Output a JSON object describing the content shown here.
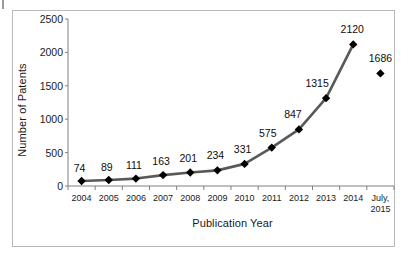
{
  "chart_data": {
    "type": "line",
    "title": "",
    "xlabel": "Publication Year",
    "ylabel": "Number of Patents",
    "categories": [
      "2004",
      "2005",
      "2006",
      "2007",
      "2008",
      "2009",
      "2010",
      "2011",
      "2012",
      "2013",
      "2014",
      "July,\n2015"
    ],
    "category_labels": [
      {
        "line1": "2004",
        "line2": ""
      },
      {
        "line1": "2005",
        "line2": ""
      },
      {
        "line1": "2006",
        "line2": ""
      },
      {
        "line1": "2007",
        "line2": ""
      },
      {
        "line1": "2008",
        "line2": ""
      },
      {
        "line1": "2009",
        "line2": ""
      },
      {
        "line1": "2010",
        "line2": ""
      },
      {
        "line1": "2011",
        "line2": ""
      },
      {
        "line1": "2012",
        "line2": ""
      },
      {
        "line1": "2013",
        "line2": ""
      },
      {
        "line1": "2014",
        "line2": ""
      },
      {
        "line1": "July,",
        "line2": "2015"
      }
    ],
    "values": [
      74,
      89,
      111,
      163,
      201,
      234,
      331,
      575,
      847,
      1315,
      2120,
      1686
    ],
    "data_labels": [
      "74",
      "89",
      "111",
      "163",
      "201",
      "234",
      "331",
      "575",
      "847",
      "1315",
      "2120",
      "1686"
    ],
    "connected_through_index": 10,
    "ylim": [
      0,
      2500
    ],
    "yticks": [
      0,
      500,
      1000,
      1500,
      2000,
      2500
    ],
    "ytick_labels": [
      "0",
      "500",
      "1000",
      "1500",
      "2000",
      "2500"
    ],
    "grid": false,
    "legend": null,
    "series_name": "Number of Patents",
    "line_color": "#595959",
    "marker_color": "#000000",
    "marker_shape": "diamond",
    "axis_color": "#808080",
    "frame_color": "#b9b9b9",
    "background": "#ffffff"
  }
}
